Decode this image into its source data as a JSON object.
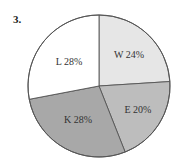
{
  "question_number": "3.",
  "chart_data": {
    "type": "pie",
    "title": "",
    "start_angle_deg": 0,
    "direction": "clockwise",
    "slices": [
      {
        "key": "W",
        "label": "W 24%",
        "value": 24,
        "color": "#e6e6e6"
      },
      {
        "key": "E",
        "label": "E 20%",
        "value": 20,
        "color": "#bdbdbd"
      },
      {
        "key": "K",
        "label": "K 28%",
        "value": 28,
        "color": "#a8a8a8"
      },
      {
        "key": "L",
        "label": "L 28%",
        "value": 28,
        "color": "#ffffff"
      }
    ],
    "categories": [
      "W",
      "E",
      "K",
      "L"
    ],
    "values": [
      24,
      20,
      28,
      28
    ],
    "legend": "none (labels inside slices)"
  }
}
